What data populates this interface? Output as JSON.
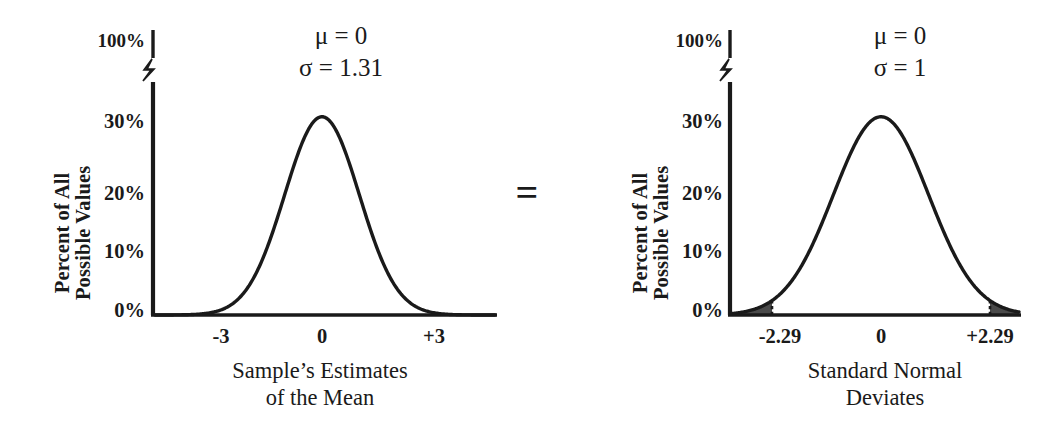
{
  "figure": {
    "relation_symbol": "=",
    "ink_color": "#1a1a1a",
    "shade_color": "#4a4a4a",
    "background_color": "#ffffff"
  },
  "panels": [
    {
      "id": "sample-estimates-of-the-mean",
      "ylabel_line1": "Percent of All",
      "ylabel_line2": "Possible Values",
      "xlabel_line1": "Sample’s Estimates",
      "xlabel_line2": "of the Mean",
      "mu_text": "μ = 0",
      "sigma_text": "σ = 1.31",
      "ytick_labels": [
        "100%",
        "30%",
        "20%",
        "10%",
        "0%"
      ],
      "xtick_labels": [
        "-3",
        "0",
        "+3"
      ]
    },
    {
      "id": "standard-normal-deviates",
      "ylabel_line1": "Percent of All",
      "ylabel_line2": "Possible Values",
      "xlabel_line1": "Standard Normal",
      "xlabel_line2": "Deviates",
      "mu_text": "μ = 0",
      "sigma_text": "σ = 1",
      "ytick_labels": [
        "100%",
        "30%",
        "20%",
        "10%",
        "0%"
      ],
      "xtick_labels": [
        "-2.29",
        "0",
        "+2.29"
      ]
    }
  ],
  "chart_data": [
    {
      "type": "area",
      "title": "",
      "xlabel": "Sample’s Estimates of the Mean",
      "ylabel": "Percent of All Possible Values",
      "distribution": "normal",
      "mu": 0,
      "sigma": 1.31,
      "peak_percent": 30.5,
      "ylim": [
        0,
        100
      ],
      "y_axis_broken": true,
      "y_axis_break_between": [
        30,
        100
      ],
      "ytick_values": [
        0,
        10,
        20,
        30,
        100
      ],
      "ytick_labels": [
        "0%",
        "10%",
        "20%",
        "30%",
        "100%"
      ],
      "xlim": [
        -4.5,
        4.5
      ],
      "xtick_values": [
        -3,
        0,
        3
      ],
      "xtick_labels": [
        "-3",
        "0",
        "+3"
      ],
      "grid": false,
      "legend": "none",
      "annotations": [
        "μ = 0",
        "σ = 1.31"
      ],
      "shaded_tails": {
        "fill": "#4a4a4a",
        "boundary_style": "dashed",
        "lower_bound": -3,
        "upper_bound": 3,
        "description": "both tails beyond ±3 are shaded"
      },
      "x": [
        -4.5,
        -4.0,
        -3.5,
        -3.0,
        -2.5,
        -2.0,
        -1.5,
        -1.0,
        -0.5,
        0.0,
        0.5,
        1.0,
        1.5,
        2.0,
        2.5,
        3.0,
        3.5,
        4.0,
        4.5
      ],
      "y": [
        0.6,
        1.4,
        2.9,
        5.4,
        9.1,
        14.0,
        19.6,
        25.0,
        29.0,
        30.5,
        29.0,
        25.0,
        19.6,
        14.0,
        9.1,
        5.4,
        2.9,
        1.4,
        0.6
      ]
    },
    {
      "type": "area",
      "title": "",
      "xlabel": "Standard Normal Deviates",
      "ylabel": "Percent of All Possible Values",
      "distribution": "normal",
      "mu": 0,
      "sigma": 1,
      "peak_percent": 30.5,
      "ylim": [
        0,
        100
      ],
      "y_axis_broken": true,
      "y_axis_break_between": [
        30,
        100
      ],
      "ytick_values": [
        0,
        10,
        20,
        30,
        100
      ],
      "ytick_labels": [
        "0%",
        "10%",
        "20%",
        "30%",
        "100%"
      ],
      "xlim": [
        -3.44,
        3.44
      ],
      "xtick_values": [
        -2.29,
        0,
        2.29
      ],
      "xtick_labels": [
        "-2.29",
        "0",
        "+2.29"
      ],
      "grid": false,
      "legend": "none",
      "annotations": [
        "μ = 0",
        "σ = 1"
      ],
      "shaded_tails": {
        "fill": "#4a4a4a",
        "boundary_style": "dashed",
        "lower_bound": -2.29,
        "upper_bound": 2.29,
        "description": "both tails beyond ±2.29 are shaded"
      },
      "x": [
        -3.44,
        -3.06,
        -2.67,
        -2.29,
        -1.91,
        -1.53,
        -1.15,
        -0.76,
        -0.38,
        0.0,
        0.38,
        0.76,
        1.15,
        1.53,
        1.91,
        2.29,
        2.67,
        3.06,
        3.44
      ],
      "y": [
        0.6,
        1.4,
        2.9,
        5.4,
        9.1,
        14.0,
        19.6,
        25.0,
        29.0,
        30.5,
        29.0,
        25.0,
        19.6,
        14.0,
        9.1,
        5.4,
        2.9,
        1.4,
        0.6
      ]
    }
  ]
}
